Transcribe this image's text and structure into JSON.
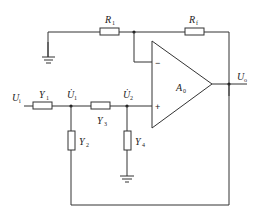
{
  "diagram": {
    "type": "active-filter-circuit",
    "components": {
      "R1": {
        "label": "R",
        "sub": "1"
      },
      "Rf": {
        "label": "R",
        "sub": "f"
      },
      "Y1": {
        "label": "Y",
        "sub": "1"
      },
      "Y2": {
        "label": "Y",
        "sub": "2"
      },
      "Y3": {
        "label": "Y",
        "sub": "3"
      },
      "Y4": {
        "label": "Y",
        "sub": "4"
      },
      "amp": {
        "label": "A",
        "sub": "0"
      }
    },
    "nodes": {
      "Ui": {
        "label": "U",
        "sub": "i"
      },
      "Uo": {
        "label": "U",
        "sub": "o"
      },
      "U1": {
        "label": "U̇",
        "sub": "1"
      },
      "U2": {
        "label": "U̇",
        "sub": "2"
      }
    },
    "amp_inputs": {
      "inverting": "−",
      "noninverting": "+"
    }
  }
}
